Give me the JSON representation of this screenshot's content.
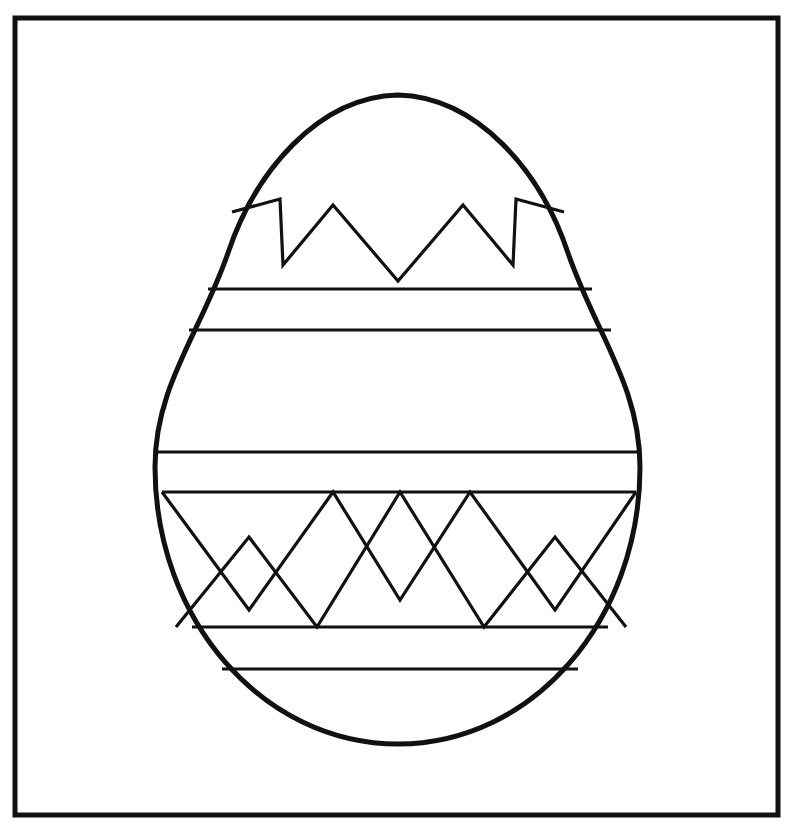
{
  "document": {
    "title": "Easter Egg Coloring Page",
    "kind": "line-art-coloring-page",
    "canvas": {
      "width": 790,
      "height": 825
    },
    "background_color": "#ffffff",
    "ink_color": "#111111"
  },
  "frame": {
    "name": "outer-border-rectangle",
    "x": 15,
    "y": 18,
    "width": 763,
    "height": 797,
    "stroke_color": "#111111",
    "stroke_width": 5,
    "fill": "none"
  },
  "egg": {
    "name": "easter-egg-outline",
    "center_x": 398,
    "top_y": 95,
    "bottom_y": 744,
    "left_x": 155,
    "right_x": 640,
    "max_width": 485,
    "height": 649,
    "widest_at_y": 452,
    "stroke_color": "#111111",
    "stroke_width": 5,
    "fill": "#ffffff",
    "path": "M 398 95 C 318 97 255 172 228 253 C 200 334 155 386 155 467 C 155 620 263 744 398 744 C 533 744 640 620 640 467 C 640 386 596 334 568 253 C 541 172 478 97 398 95 Z"
  },
  "decorations": {
    "stroke_color": "#111111",
    "stroke_width": 3.2,
    "bands": [
      {
        "name": "band-line-1",
        "type": "horizontal",
        "y": 289,
        "x1": 208,
        "x2": 592,
        "label": "upper band top line"
      },
      {
        "name": "band-line-2",
        "type": "horizontal",
        "y": 330,
        "x1": 189,
        "x2": 611,
        "label": "upper band bottom line"
      },
      {
        "name": "band-line-3",
        "type": "horizontal",
        "y": 452,
        "x1": 157,
        "x2": 639,
        "label": "middle band top line"
      },
      {
        "name": "band-line-4",
        "type": "horizontal",
        "y": 492,
        "x1": 162,
        "x2": 636,
        "label": "middle band bottom line / zigzag baseline"
      },
      {
        "name": "band-line-5",
        "type": "horizontal",
        "y": 627,
        "x1": 192,
        "x2": 608,
        "label": "lower band top line"
      },
      {
        "name": "band-line-6",
        "type": "horizontal",
        "y": 669,
        "x1": 222,
        "x2": 578,
        "label": "lower band bottom line"
      }
    ],
    "top_zigzag": {
      "name": "top-crown-zigzag",
      "description": "jagged crown / cracked-shell line across upper egg",
      "points": "232,212 280,199 283,265 333,205 398,281 463,205 513,265 516,199 564,212"
    },
    "lower_zigzag_outer": {
      "name": "lower-chevron-zigzag-outer",
      "description": "outer chevron zigzag of the lower decorative band",
      "points": "162,492 249,610 333,492 400,600 470,492 555,610 636,492"
    },
    "lower_zigzag_inner": {
      "name": "lower-chevron-zigzag-inner",
      "description": "inner offset chevron zigzag of the lower decorative band",
      "points": "176,627 249,537 317,627 400,492 484,627 555,537 626,627"
    }
  }
}
